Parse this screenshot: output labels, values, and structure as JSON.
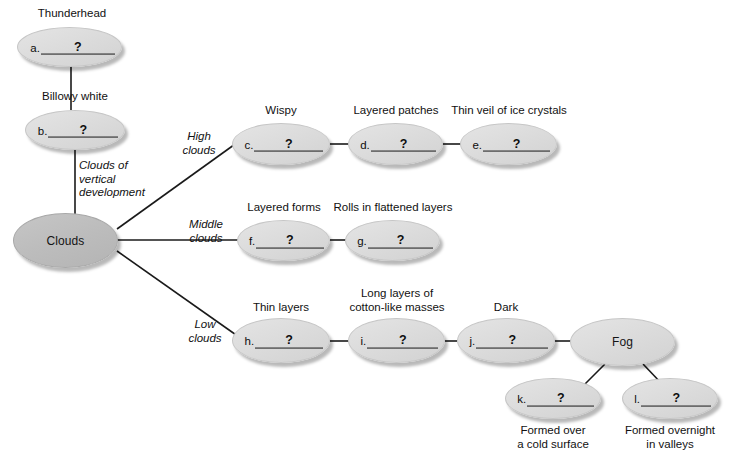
{
  "diagram": {
    "title_partial_top": "",
    "root": {
      "id": "clouds",
      "label": "Clouds"
    },
    "branch_labels": {
      "vertical": "Clouds of\nvertical\ndevelopment",
      "high": "High\nclouds",
      "middle": "Middle\nclouds",
      "low": "Low\nclouds"
    },
    "nodes": [
      {
        "id": "a",
        "letter": "a.",
        "mark": "?",
        "caption": "Thunderhead",
        "caption_pos": "above"
      },
      {
        "id": "b",
        "letter": "b.",
        "mark": "?",
        "caption": "Billowy white",
        "caption_pos": "above"
      },
      {
        "id": "c",
        "letter": "c.",
        "mark": "?",
        "caption": "Wispy",
        "caption_pos": "above"
      },
      {
        "id": "d",
        "letter": "d.",
        "mark": "?",
        "caption": "Layered patches",
        "caption_pos": "above"
      },
      {
        "id": "e",
        "letter": "e.",
        "mark": "?",
        "caption": "Thin veil of ice crystals",
        "caption_pos": "above"
      },
      {
        "id": "f",
        "letter": "f.",
        "mark": "?",
        "caption": "Layered forms",
        "caption_pos": "above"
      },
      {
        "id": "g",
        "letter": "g.",
        "mark": "?",
        "caption": "Rolls in flattened layers",
        "caption_pos": "above"
      },
      {
        "id": "h",
        "letter": "h.",
        "mark": "?",
        "caption": "Thin layers",
        "caption_pos": "above"
      },
      {
        "id": "i",
        "letter": "i.",
        "mark": "?",
        "caption": "Long layers of\ncotton-like masses",
        "caption_pos": "above"
      },
      {
        "id": "j",
        "letter": "j.",
        "mark": "?",
        "caption": "Dark",
        "caption_pos": "above"
      },
      {
        "id": "k",
        "letter": "k.",
        "mark": "?",
        "caption": "Formed over\na cold surface",
        "caption_pos": "below"
      },
      {
        "id": "l",
        "letter": "l.",
        "mark": "?",
        "caption": "Formed overnight\nin valleys",
        "caption_pos": "below"
      }
    ],
    "fog": {
      "id": "fog",
      "label": "Fog"
    },
    "colors": {
      "node_fill": "#dcdcdc",
      "node_fill_dark": "#bdbdbd",
      "node_edge": "#c6c6c6",
      "connector": "#1a1a1a",
      "text": "#111111",
      "background": "#ffffff"
    }
  }
}
